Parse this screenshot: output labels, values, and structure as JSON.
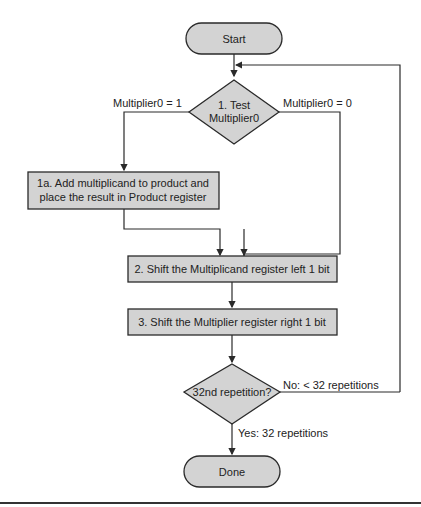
{
  "flowchart": {
    "start": {
      "label": "Start"
    },
    "test": {
      "line1": "1. Test",
      "line2": "Multiplier0"
    },
    "branch_left": {
      "label": "Multiplier0 = 1"
    },
    "branch_right": {
      "label": "Multiplier0 = 0"
    },
    "step1a": {
      "line1": "1a. Add multiplicand to product and",
      "line2": "place the result in Product register"
    },
    "step2": {
      "label": "2. Shift the Multiplicand register left 1 bit"
    },
    "step3": {
      "label": "3. Shift the Multiplier register right 1 bit"
    },
    "decision": {
      "label": "32nd repetition?"
    },
    "no_branch": {
      "label": "No:  < 32 repetitions"
    },
    "yes_branch": {
      "label": "Yes:  32 repetitions"
    },
    "done": {
      "label": "Done"
    }
  },
  "colors": {
    "shape_fill": "#d3d3d3",
    "stroke": "#2a2a2a",
    "background": "#ffffff"
  }
}
